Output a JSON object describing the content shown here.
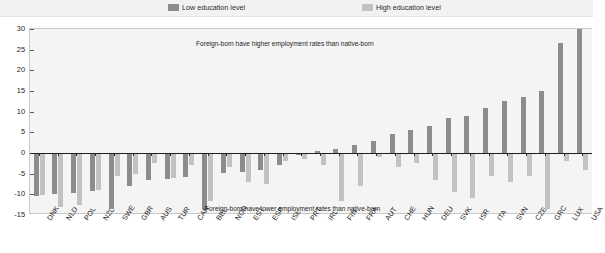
{
  "legend": {
    "items": [
      {
        "label": "Low education level",
        "color": "#8c8c8c",
        "key": "low"
      },
      {
        "label": "High education level",
        "color": "#c2c2c2",
        "key": "high"
      }
    ]
  },
  "annotations": {
    "top": "Foreign-born have higher employment rates than native-born",
    "bottom": "Foreign-born have lower employment rates than native-born"
  },
  "colors": {
    "low_education": "#8c8c8c",
    "high_education": "#c2c2c2",
    "plot_background": "#f4f4f4",
    "legend_background": "#f2f2f2",
    "axis": "#1f1f1f"
  },
  "chart_data": {
    "type": "bar",
    "title": "",
    "subtitle": "",
    "xlabel": "",
    "ylabel": "",
    "ylim": [
      -15,
      30
    ],
    "yticks": [
      -15,
      -10,
      -5,
      0,
      5,
      10,
      15,
      20,
      25,
      30
    ],
    "grid": false,
    "legend_position": "top",
    "annotations": [
      "Foreign-born have higher employment rates than native-born",
      "Foreign-born have lower employment rates than native-born"
    ],
    "categories": [
      "DNK",
      "NLD",
      "POL",
      "NZL",
      "SWE",
      "GBR",
      "AUS",
      "TUR",
      "CAN",
      "BEL",
      "NOR",
      "EST",
      "ESP",
      "ISL",
      "PRT",
      "IRL",
      "FIN",
      "FRA",
      "AUT",
      "CHE",
      "HUN",
      "DEU",
      "SVK",
      "ISR",
      "ITA",
      "SVN",
      "CZE",
      "GRC",
      "LUX",
      "USA"
    ],
    "series": [
      {
        "name": "Low education level",
        "color": "#8c8c8c",
        "values": [
          -10.5,
          -9.8,
          -9.6,
          -9.2,
          -13.5,
          -8.0,
          -6.5,
          -6.4,
          -5.8,
          -13.5,
          -4.8,
          -4.5,
          -4.2,
          -3.0,
          -0.5,
          0.5,
          1.0,
          2.0,
          3.0,
          4.5,
          5.5,
          6.5,
          8.5,
          9.0,
          11.0,
          12.5,
          13.5,
          15.0,
          26.5,
          30.0
        ]
      },
      {
        "name": "High education level",
        "color": "#c2c2c2",
        "values": [
          -10.2,
          -13.0,
          -12.5,
          -9.0,
          -5.5,
          -5.0,
          -2.5,
          -6.0,
          -3.0,
          -11.5,
          -3.5,
          -7.0,
          -7.5,
          -2.0,
          -1.5,
          -3.0,
          -11.5,
          -8.0,
          -1.0,
          -3.5,
          -2.5,
          -6.5,
          -9.5,
          -11.0,
          -5.5,
          -7.0,
          -5.5,
          -13.5,
          -2.0,
          -4.0
        ]
      }
    ]
  }
}
